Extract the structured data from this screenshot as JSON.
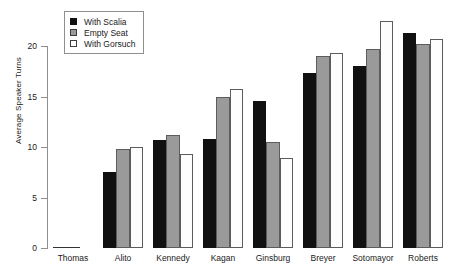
{
  "chart_data": {
    "type": "bar",
    "title": "",
    "xlabel": "",
    "ylabel": "Average Speaker Turns",
    "ylim": [
      0,
      23
    ],
    "yticks": [
      0,
      5,
      10,
      15,
      20
    ],
    "ytick_labels": [
      "0",
      "5",
      "10",
      "15",
      "20"
    ],
    "grid": false,
    "legend_position": "top-left",
    "categories": [
      "Thomas",
      "Alito",
      "Kennedy",
      "Kagan",
      "Ginsburg",
      "Breyer",
      "Sotomayor",
      "Roberts"
    ],
    "series": [
      {
        "name": "With Scalia",
        "color": "#111111",
        "values": [
          0.1,
          7.5,
          10.7,
          10.8,
          14.6,
          17.3,
          18.0,
          21.3
        ]
      },
      {
        "name": "Empty Seat",
        "color": "#9a9a9a",
        "values": [
          0.05,
          9.8,
          11.2,
          15.0,
          10.5,
          19.0,
          19.7,
          20.2
        ]
      },
      {
        "name": "With Gorsuch",
        "color": "#ffffff",
        "values": [
          0.0,
          10.0,
          9.3,
          15.7,
          8.9,
          19.3,
          22.5,
          20.7
        ]
      }
    ]
  },
  "axes": {
    "y_title": "Average Speaker Turns"
  },
  "legend": {
    "entries": [
      {
        "label": "With Scalia",
        "swatch": "filled-black-square-icon"
      },
      {
        "label": "Empty Seat",
        "swatch": "filled-gray-square-icon"
      },
      {
        "label": "With Gorsuch",
        "swatch": "open-white-square-icon"
      }
    ]
  }
}
